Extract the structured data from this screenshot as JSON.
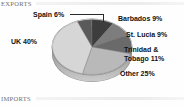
{
  "sections": {
    "exports_label": "EXPORTS",
    "imports_label": "IMPORTS"
  },
  "chart_data": {
    "type": "pie",
    "title": "EXPORTS",
    "xlabel": "",
    "ylabel": "",
    "unit": "percent",
    "legend_position": "none",
    "grid": false,
    "categories": [
      "Spain",
      "Barbados",
      "St. Lucia",
      "Trinidad & Tobago",
      "Other",
      "UK"
    ],
    "values": [
      6,
      9,
      9,
      11,
      25,
      40
    ],
    "labels": [
      "Spain 6%",
      "Barbados 9%",
      "St. Lucia 9%",
      "Trinidad & Tobago 11%",
      "Other 25%",
      "UK 40%"
    ],
    "slices": [
      {
        "name": "Spain",
        "label": "Spain 6%",
        "value": 6,
        "color": "#5a5a5a"
      },
      {
        "name": "Barbados",
        "label": "Barbados 9%",
        "value": 9,
        "color": "#3d3d3d"
      },
      {
        "name": "St. Lucia",
        "label": "St. Lucia 9%",
        "value": 9,
        "color": "#7d7d7d"
      },
      {
        "name": "Trinidad & Tobago",
        "label": "Trinidad & Tobago 11%",
        "value": 11,
        "color": "#6a6a6a"
      },
      {
        "name": "Other",
        "label": "Other 25%",
        "value": 25,
        "color": "#b9b9b9"
      },
      {
        "name": "UK",
        "label": "UK 40%",
        "value": 40,
        "color": "#d6d6d6"
      }
    ]
  },
  "labels": {
    "spain": "Spain 6%",
    "barbados": "Barbados 9%",
    "st_lucia": "St. Lucia 9%",
    "trinidad_line1": "Trinidad &",
    "trinidad_line2": "Tobago 11%",
    "other": "Other 25%",
    "uk": "UK 40%"
  }
}
